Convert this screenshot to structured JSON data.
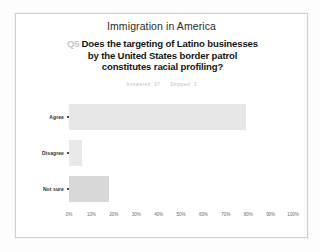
{
  "card": {
    "survey_title": "Immigration in America",
    "question_number": "Q5",
    "question_lines": [
      "Does the targeting of Latino businesses",
      "by the United States border patrol",
      "constitutes racial profiling?"
    ],
    "meta": {
      "answered": "Answered: 97",
      "skipped": "Skipped: 3"
    }
  },
  "chart_data": {
    "type": "bar",
    "orientation": "horizontal",
    "title": "Does the targeting of Latino businesses by the United States border patrol constitutes racial profiling?",
    "xlabel": "",
    "ylabel": "",
    "categories": [
      "Agree",
      "Disagree",
      "Not sure"
    ],
    "values": [
      79,
      6,
      18
    ],
    "value_unit": "%",
    "xlim": [
      0,
      100
    ],
    "xticks": [
      0,
      10,
      20,
      30,
      40,
      50,
      60,
      70,
      80,
      90,
      100
    ],
    "xticklabels": [
      "0%",
      "10%",
      "20%",
      "30%",
      "40%",
      "50%",
      "60%",
      "70%",
      "80%",
      "90%",
      "100%"
    ],
    "grid": false,
    "legend": false,
    "bar_colors": [
      "#e6e6e6",
      "#e9e9e9",
      "#d8d8d8"
    ]
  },
  "colors": {
    "page_background": "#fdfdfd",
    "card_background": "#ffffff",
    "card_border": "#cfcfcf",
    "question_text": "#161616",
    "question_number": "#c3c9cf",
    "meta_text": "#b9bdc2",
    "tick_text": "#6d6d6d",
    "category_text": "#303030"
  }
}
